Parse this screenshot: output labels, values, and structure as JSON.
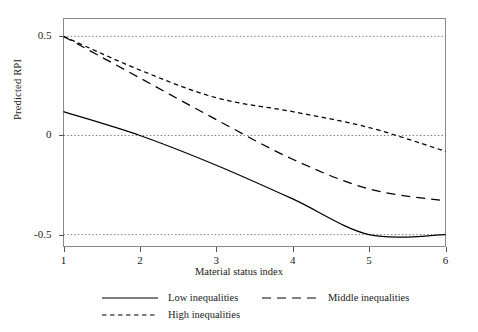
{
  "chart_data": {
    "type": "line",
    "title": "",
    "xlabel": "Material status index",
    "ylabel": "Predicted RPI",
    "x": [
      1,
      2,
      3,
      4,
      5,
      6
    ],
    "xlim": [
      1,
      6
    ],
    "ylim": [
      -0.56,
      0.59
    ],
    "xticks": [
      "1",
      "2",
      "3",
      "4",
      "5",
      "6"
    ],
    "yticks": [
      "0.5",
      "0",
      "-0.5"
    ],
    "ytick_values": [
      0.5,
      0,
      -0.5
    ],
    "grid": "dotted horizontal gridlines at 0.5, 0 and -0.5",
    "legend_position": "below plot",
    "series": [
      {
        "name": "Low inequalities",
        "style": "solid",
        "values": [
          0.12,
          0.0,
          -0.15,
          -0.32,
          -0.5,
          -0.5
        ]
      },
      {
        "name": "Middle inequalities",
        "style": "long-dash",
        "values": [
          0.5,
          0.29,
          0.08,
          -0.12,
          -0.27,
          -0.33
        ]
      },
      {
        "name": "High inequalities",
        "style": "short-dash",
        "values": [
          0.5,
          0.33,
          0.19,
          0.12,
          0.04,
          -0.08
        ]
      }
    ]
  },
  "axes": {
    "y_title": "Predicted RPI",
    "x_title": "Material status index",
    "y_labels": [
      "0.5",
      "0",
      "-0.5"
    ],
    "x_labels": [
      "1",
      "2",
      "3",
      "4",
      "5",
      "6"
    ]
  },
  "legend": {
    "items": [
      {
        "label": "Low inequalities",
        "style": "solid"
      },
      {
        "label": "Middle inequalities",
        "style": "long-dash"
      },
      {
        "label": "High inequalities",
        "style": "short-dash"
      }
    ]
  },
  "colors": {
    "line": "#000000",
    "frame": "#8a8a8a",
    "grid": "#555555",
    "background": "#ffffff"
  }
}
